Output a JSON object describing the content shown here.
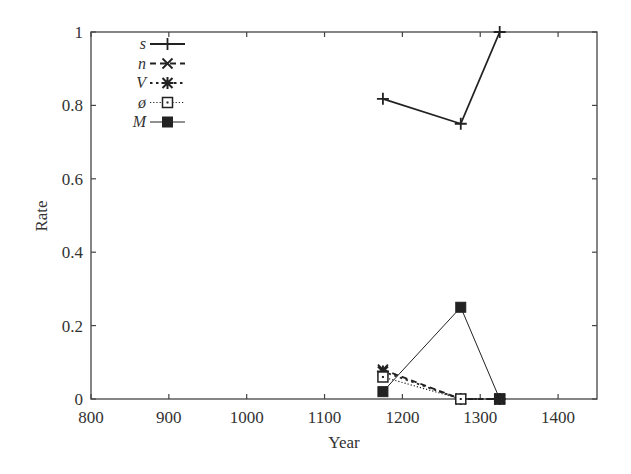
{
  "chart_data": {
    "type": "line",
    "title": "",
    "xlabel": "Year",
    "ylabel": "Rate",
    "xlim": [
      800,
      1450
    ],
    "ylim": [
      0,
      1
    ],
    "xticks": [
      800,
      900,
      1000,
      1100,
      1200,
      1300,
      1400
    ],
    "xtick_labels": [
      "800",
      "900",
      "1000",
      "1100",
      "1200",
      "1300",
      "1400"
    ],
    "yticks": [
      0,
      0.2,
      0.4,
      0.6,
      0.8,
      1
    ],
    "ytick_labels": [
      "0",
      "0.2",
      "0.4",
      "0.6",
      "0.8",
      "1"
    ],
    "grid": false,
    "legend_position": "top-left",
    "x": [
      1175,
      1275,
      1325
    ],
    "series": [
      {
        "name": "s",
        "values": [
          0.818,
          0.75,
          1.0
        ],
        "line": "solid",
        "marker": "plus",
        "width": 1.8
      },
      {
        "name": "n",
        "values": [
          0.08,
          0.0,
          0.0
        ],
        "line": "dashed",
        "marker": "cross",
        "width": 1.8
      },
      {
        "name": "V",
        "values": [
          0.075,
          0.0,
          0.0
        ],
        "line": "dotted",
        "marker": "star",
        "width": 1.8
      },
      {
        "name": "ø",
        "values": [
          0.06,
          0.0,
          0.0
        ],
        "line": "fine-dotted",
        "marker": "open-square",
        "width": 1.2
      },
      {
        "name": "M",
        "values": [
          0.02,
          0.25,
          0.0
        ],
        "line": "solid-thin",
        "marker": "filled-square",
        "width": 1.0
      }
    ]
  },
  "colors": {
    "line": "#222222",
    "axis": "#444444",
    "background": "#ffffff"
  }
}
